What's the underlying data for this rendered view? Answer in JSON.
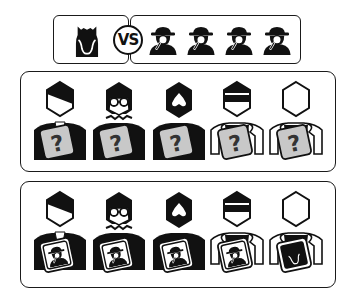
{
  "top_banner": {
    "vs_label": "VS",
    "left_team": {
      "role": "monster",
      "icon": "monster-icon",
      "count": 1
    },
    "right_team": {
      "role": "detective",
      "icon": "detective-icon",
      "count": 4
    }
  },
  "rows": [
    {
      "name": "unknown-roles-row",
      "card_style": "question",
      "card_label": "?",
      "card_color": "#c8c8c8",
      "characters": [
        {
          "name": "businessman",
          "icon": "businessman-icon"
        },
        {
          "name": "woman-glasses",
          "icon": "woman-with-glasses-icon"
        },
        {
          "name": "bearded-man",
          "icon": "bearded-man-icon"
        },
        {
          "name": "sunglasses-man",
          "icon": "sunglasses-man-icon"
        },
        {
          "name": "blank-person",
          "icon": "blank-person-icon"
        }
      ]
    },
    {
      "name": "revealed-roles-row",
      "card_style": "revealed",
      "card_color": "#ffffff",
      "characters": [
        {
          "name": "businessman",
          "icon": "businessman-icon",
          "card_role": "detective"
        },
        {
          "name": "woman-glasses",
          "icon": "woman-with-glasses-icon",
          "card_role": "detective"
        },
        {
          "name": "bearded-man",
          "icon": "bearded-man-icon",
          "card_role": "detective"
        },
        {
          "name": "sunglasses-man",
          "icon": "sunglasses-man-icon",
          "card_role": "detective"
        },
        {
          "name": "blank-person",
          "icon": "blank-person-icon",
          "card_role": "monster"
        }
      ]
    }
  ],
  "colors": {
    "ink": "#111111",
    "card_gray": "#c8c8c8",
    "border": "#1a1a1a"
  }
}
